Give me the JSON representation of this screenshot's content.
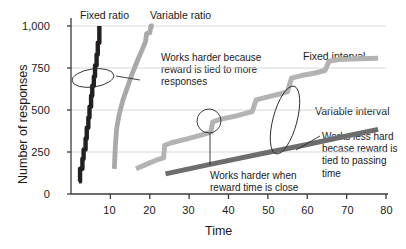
{
  "chart_data": {
    "type": "line",
    "title": "",
    "xlabel": "Time",
    "ylabel": "Number of responses",
    "xlim": [
      0,
      80
    ],
    "ylim": [
      0,
      1000
    ],
    "xticks": [
      10,
      20,
      30,
      40,
      50,
      60,
      70,
      80
    ],
    "xtick_labels": [
      "10",
      "20",
      "30",
      "40",
      "50",
      "60",
      "70",
      "80"
    ],
    "yticks": [
      0,
      250,
      500,
      750,
      1000
    ],
    "ytick_labels": [
      "0",
      "250",
      "500",
      "750",
      "1,000"
    ],
    "grid": "horizontal",
    "legend": "inline-labels",
    "series": [
      {
        "name": "Fixed ratio",
        "label": "Fixed ratio",
        "color": "#231f20",
        "width": 4.4,
        "style": "stair-stepped steep",
        "points": [
          [
            2.0,
            75
          ],
          [
            2.3,
            75
          ],
          [
            2.3,
            150
          ],
          [
            2.9,
            150
          ],
          [
            2.9,
            210
          ],
          [
            3.2,
            210
          ],
          [
            3.2,
            265
          ],
          [
            3.7,
            265
          ],
          [
            3.7,
            330
          ],
          [
            4.0,
            330
          ],
          [
            4.0,
            395
          ],
          [
            4.4,
            395
          ],
          [
            4.4,
            455
          ],
          [
            4.7,
            455
          ],
          [
            4.7,
            520
          ],
          [
            5.1,
            520
          ],
          [
            5.1,
            585
          ],
          [
            5.4,
            585
          ],
          [
            5.4,
            645
          ],
          [
            5.8,
            645
          ],
          [
            5.8,
            700
          ],
          [
            6.1,
            700
          ],
          [
            6.1,
            765
          ],
          [
            6.5,
            765
          ],
          [
            6.5,
            830
          ],
          [
            6.8,
            830
          ],
          [
            6.8,
            900
          ],
          [
            7.2,
            900
          ],
          [
            7.2,
            1000
          ]
        ]
      },
      {
        "name": "Variable ratio",
        "label": "Variable ratio",
        "color": "#a9a9a9",
        "width": 4.8,
        "style": "steep smooth with small steps",
        "points": [
          [
            11.0,
            150
          ],
          [
            11.3,
            300
          ],
          [
            11.6,
            390
          ],
          [
            12.2,
            470
          ],
          [
            13.2,
            560
          ],
          [
            14.4,
            640
          ],
          [
            15.6,
            720
          ],
          [
            16.8,
            790
          ],
          [
            18.0,
            855
          ],
          [
            18.9,
            905
          ],
          [
            19.2,
            955
          ],
          [
            20.0,
            960
          ],
          [
            20.3,
            1000
          ],
          [
            21.0,
            1000
          ]
        ]
      },
      {
        "name": "Fixed interval",
        "label": "Fixed interval",
        "color": "#b3b3b3",
        "width": 5.0,
        "style": "scalloped step-plateau",
        "points": [
          [
            16.5,
            150
          ],
          [
            19.0,
            175
          ],
          [
            22.0,
            205
          ],
          [
            23.5,
            215
          ],
          [
            23.8,
            290
          ],
          [
            25.5,
            305
          ],
          [
            29.0,
            325
          ],
          [
            33.0,
            350
          ],
          [
            35.5,
            368
          ],
          [
            36.0,
            430
          ],
          [
            38.0,
            445
          ],
          [
            42.0,
            465
          ],
          [
            46.0,
            490
          ],
          [
            47.0,
            560
          ],
          [
            49.5,
            575
          ],
          [
            53.0,
            595
          ],
          [
            55.0,
            610
          ],
          [
            56.0,
            690
          ],
          [
            58.5,
            705
          ],
          [
            62.0,
            720
          ],
          [
            64.5,
            735
          ],
          [
            65.5,
            790
          ],
          [
            68.0,
            800
          ],
          [
            73.0,
            805
          ],
          [
            78.0,
            808
          ]
        ]
      },
      {
        "name": "Variable interval",
        "label": "Variable interval",
        "color": "#6d6d6d",
        "width": 5.0,
        "style": "straight shallow slope",
        "points": [
          [
            24.0,
            120
          ],
          [
            35.0,
            175
          ],
          [
            48.0,
            238
          ],
          [
            60.0,
            295
          ],
          [
            70.0,
            345
          ],
          [
            78.0,
            385
          ]
        ]
      }
    ],
    "series_labels": [
      {
        "text": "Fixed ratio",
        "x_px": 80,
        "y_px": 9
      },
      {
        "text": "Variable ratio",
        "x_px": 150,
        "y_px": 9
      },
      {
        "text": "Fixed interval",
        "x_px": 303,
        "y_px": 50
      },
      {
        "text": "Variable interval",
        "x_px": 315,
        "y_px": 105
      }
    ],
    "annotations": [
      {
        "id": "works-harder-responses",
        "text": "Works harder because\nreward is tied to more\nresponses",
        "x_px": 161,
        "y_px": 52,
        "callout": "ellipse",
        "target_shape": {
          "cx": 93,
          "cy": 78,
          "rx": 21,
          "ry": 9,
          "rotate": -8
        }
      },
      {
        "id": "works-harder-reward-time",
        "text": "Works harder when\nreward time is close",
        "x_px": 210,
        "y_px": 170,
        "callout": "circle",
        "target_shape": {
          "cx": 209,
          "cy": 121,
          "rx": 12,
          "ry": 12,
          "rotate": 0
        }
      },
      {
        "id": "works-less-hard",
        "text": "Works less hard\nbecase reward is\ntied to passing\ntime",
        "x_px": 322,
        "y_px": 131,
        "callout": "ellipse",
        "target_shape": {
          "cx": 285,
          "cy": 120,
          "rx": 12,
          "ry": 35,
          "rotate": 15
        }
      }
    ]
  },
  "axes": {
    "y_axis_title": "Number of responses",
    "x_axis_title": "Time",
    "y_tick_labels": [
      "1,000",
      "750",
      "500",
      "250",
      "0"
    ],
    "x_tick_labels": [
      "10",
      "20",
      "30",
      "40",
      "50",
      "60",
      "70",
      "80"
    ]
  },
  "colors": {
    "fixed_ratio": "#231f20",
    "variable_ratio": "#a9a9a9",
    "fixed_interval": "#b3b3b3",
    "variable_interval": "#6d6d6d",
    "axis": "#3a3a3a",
    "grid": "#d8d8d8",
    "text": "#1a1a1a",
    "background": "#ffffff"
  }
}
